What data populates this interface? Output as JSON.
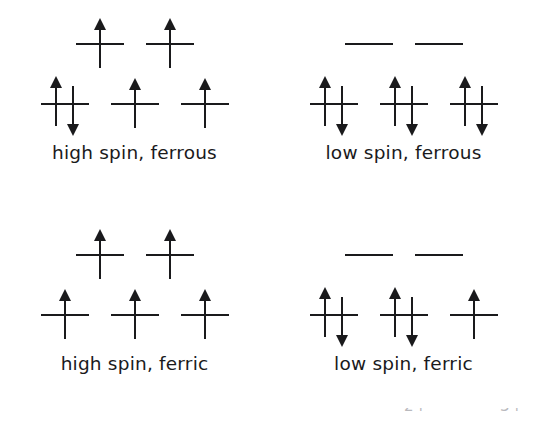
{
  "figure": {
    "type": "crystal-field-splitting-diagram",
    "background_color": "#ffffff",
    "ink_color": "#1a1a1c",
    "panels": [
      {
        "id": "high-spin-ferrous",
        "label": "high spin, ferrous",
        "levels": [
          {
            "name": "eg",
            "orbitals": [
              {
                "electrons": [
                  "up"
                ]
              },
              {
                "electrons": [
                  "up"
                ]
              }
            ]
          },
          {
            "name": "t2g",
            "orbitals": [
              {
                "electrons": [
                  "up",
                  "down"
                ]
              },
              {
                "electrons": [
                  "up"
                ]
              },
              {
                "electrons": [
                  "up"
                ]
              }
            ]
          }
        ]
      },
      {
        "id": "low-spin-ferrous",
        "label": "low spin, ferrous",
        "levels": [
          {
            "name": "eg",
            "orbitals": [
              {
                "electrons": []
              },
              {
                "electrons": []
              }
            ]
          },
          {
            "name": "t2g",
            "orbitals": [
              {
                "electrons": [
                  "up",
                  "down"
                ]
              },
              {
                "electrons": [
                  "up",
                  "down"
                ]
              },
              {
                "electrons": [
                  "up",
                  "down"
                ]
              }
            ]
          }
        ]
      },
      {
        "id": "high-spin-ferric",
        "label": "high spin, ferric",
        "levels": [
          {
            "name": "eg",
            "orbitals": [
              {
                "electrons": [
                  "up"
                ]
              },
              {
                "electrons": [
                  "up"
                ]
              }
            ]
          },
          {
            "name": "t2g",
            "orbitals": [
              {
                "electrons": [
                  "up"
                ]
              },
              {
                "electrons": [
                  "up"
                ]
              },
              {
                "electrons": [
                  "up"
                ]
              }
            ]
          }
        ]
      },
      {
        "id": "low-spin-ferric",
        "label": "low spin, ferric",
        "levels": [
          {
            "name": "eg",
            "orbitals": [
              {
                "electrons": []
              },
              {
                "electrons": []
              }
            ]
          },
          {
            "name": "t2g",
            "orbitals": [
              {
                "electrons": [
                  "up",
                  "down"
                ]
              },
              {
                "electrons": [
                  "up",
                  "down"
                ]
              },
              {
                "electrons": [
                  "up"
                ]
              }
            ]
          }
        ]
      }
    ],
    "cropped_artifacts": [
      "2+",
      "3+"
    ]
  }
}
